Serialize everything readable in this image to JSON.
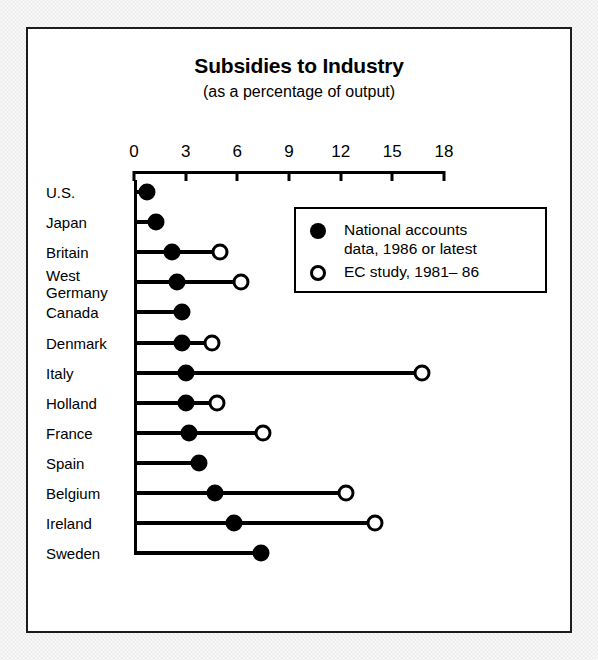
{
  "chart_data": {
    "type": "bar",
    "title": "Subsidies to Industry",
    "subtitle": "(as a percentage of output)",
    "xlabel": "",
    "ylabel": "",
    "xlim": [
      0,
      18
    ],
    "xticks": [
      0,
      3,
      6,
      9,
      12,
      15,
      18
    ],
    "xtick_labels": [
      "0",
      "3",
      "6",
      "9",
      "12",
      "15",
      "18"
    ],
    "grid": false,
    "legend_position": "inside-upper-right",
    "categories": [
      "U.S.",
      "Japan",
      "Britain",
      "West Germany",
      "Canada",
      "Denmark",
      "Italy",
      "Holland",
      "France",
      "Spain",
      "Belgium",
      "Ireland",
      "Sweden"
    ],
    "series": [
      {
        "name": "National accounts data, 1986 or latest",
        "marker": "filled-circle",
        "values": [
          0.75,
          1.3,
          2.2,
          2.5,
          2.8,
          2.8,
          3.0,
          3.0,
          3.2,
          3.8,
          4.7,
          5.8,
          7.4
        ]
      },
      {
        "name": "EC study, 1981– 86",
        "marker": "open-circle",
        "values": [
          null,
          null,
          5.0,
          6.2,
          null,
          4.5,
          16.7,
          4.8,
          7.5,
          null,
          12.3,
          14.0,
          null
        ]
      }
    ]
  },
  "rows": [
    {
      "label": "U.S.",
      "label_line2": "",
      "filled": 0.75,
      "open": null
    },
    {
      "label": "Japan",
      "label_line2": "",
      "filled": 1.3,
      "open": null
    },
    {
      "label": "Britain",
      "label_line2": "",
      "filled": 2.2,
      "open": 5.0
    },
    {
      "label": "West",
      "label_line2": "Germany",
      "filled": 2.5,
      "open": 6.2
    },
    {
      "label": "Canada",
      "label_line2": "",
      "filled": 2.8,
      "open": null
    },
    {
      "label": "Denmark",
      "label_line2": "",
      "filled": 2.8,
      "open": 4.5
    },
    {
      "label": "Italy",
      "label_line2": "",
      "filled": 3.0,
      "open": 16.7
    },
    {
      "label": "Holland",
      "label_line2": "",
      "filled": 3.0,
      "open": 4.8
    },
    {
      "label": "France",
      "label_line2": "",
      "filled": 3.2,
      "open": 7.5
    },
    {
      "label": "Spain",
      "label_line2": "",
      "filled": 3.8,
      "open": null
    },
    {
      "label": "Belgium",
      "label_line2": "",
      "filled": 4.7,
      "open": 12.3
    },
    {
      "label": "Ireland",
      "label_line2": "",
      "filled": 5.8,
      "open": 14.0
    },
    {
      "label": "Sweden",
      "label_line2": "",
      "filled": 7.4,
      "open": null
    }
  ],
  "legend": {
    "entries": [
      {
        "marker": "filled-circle",
        "text": "National accounts\ndata, 1986 or latest"
      },
      {
        "marker": "open-circle",
        "text": "EC study, 1981– 86"
      }
    ]
  },
  "colors": {
    "ink": "#000000",
    "panel": "#ffffff",
    "page": "#f2f2f2",
    "frame": "#1c1c1c"
  }
}
